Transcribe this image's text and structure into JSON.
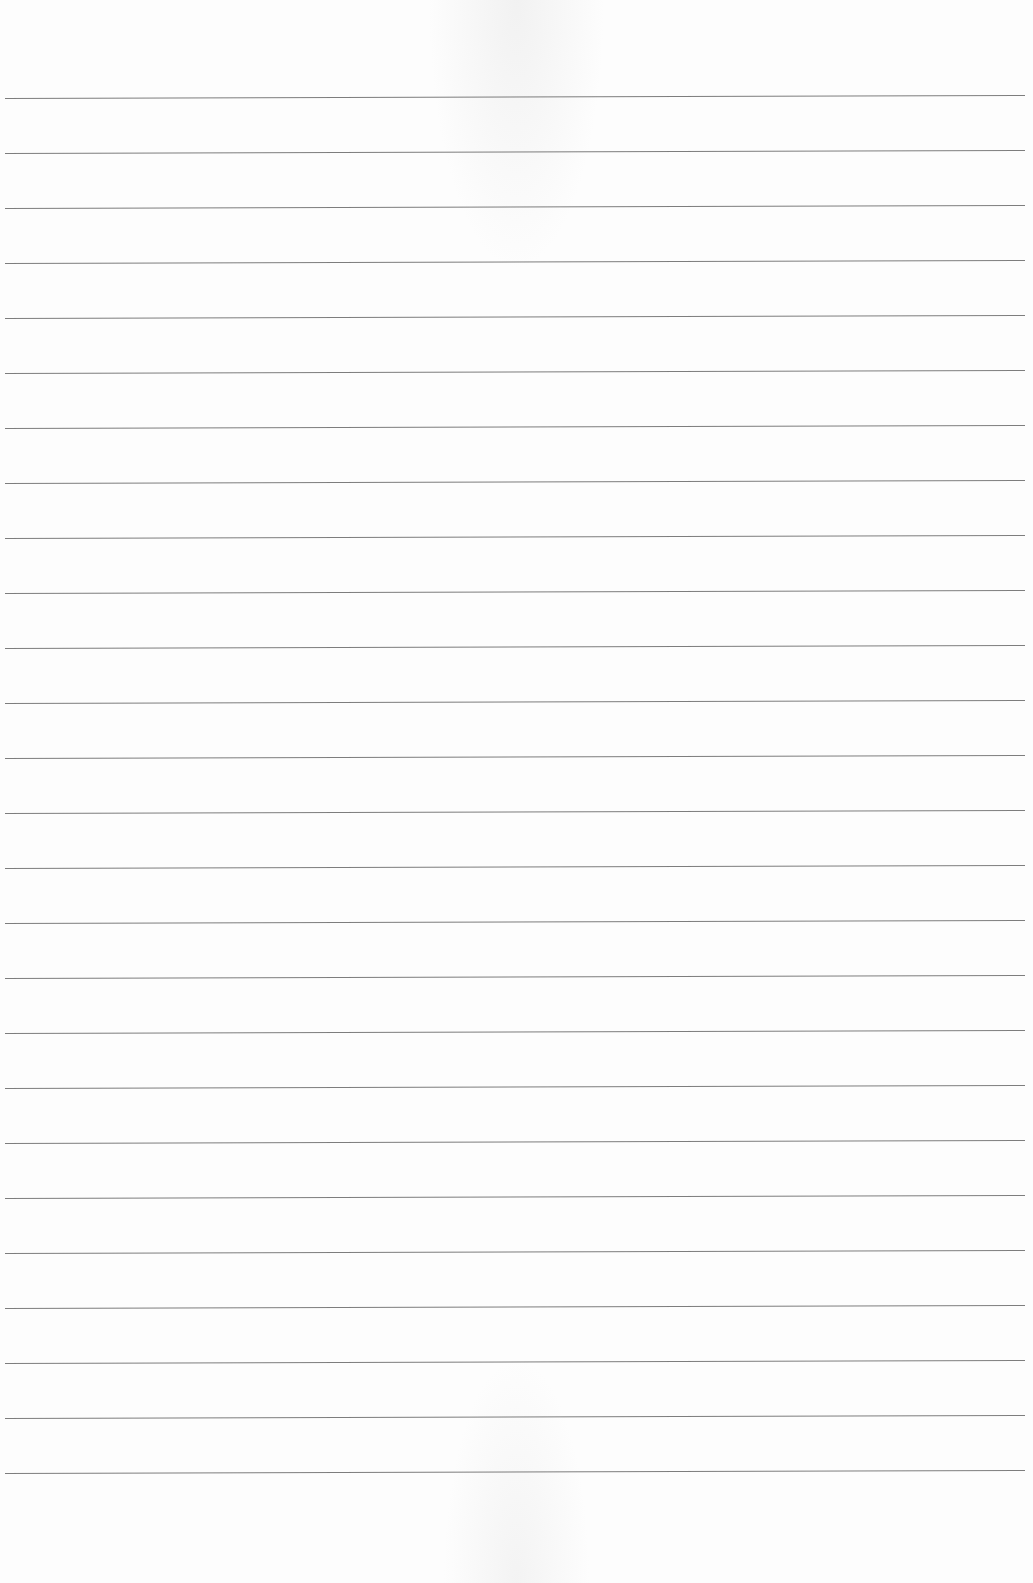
{
  "page": {
    "type": "lined-paper",
    "background_color": "#fdfdfd",
    "line_color": "#6f6f6f",
    "line_count": 26,
    "first_line_y": 98,
    "line_spacing": 55,
    "line_left_x": 5,
    "line_width": 1020
  }
}
